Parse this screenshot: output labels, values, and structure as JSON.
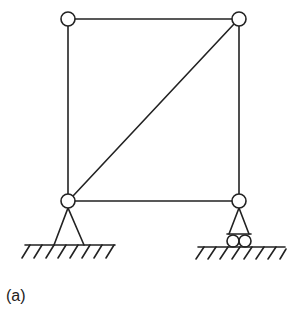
{
  "figure": {
    "caption": "(a)",
    "type": "truss-frame",
    "colors": {
      "stroke": "#222222",
      "background": "#ffffff"
    },
    "nodes": [
      {
        "id": "top-left",
        "x": 68,
        "y": 19
      },
      {
        "id": "top-right",
        "x": 239,
        "y": 19
      },
      {
        "id": "bottom-left",
        "x": 68,
        "y": 201
      },
      {
        "id": "bottom-right",
        "x": 239,
        "y": 201
      }
    ],
    "members": [
      {
        "from": "top-left",
        "to": "top-right"
      },
      {
        "from": "top-left",
        "to": "bottom-left"
      },
      {
        "from": "top-right",
        "to": "bottom-right"
      },
      {
        "from": "bottom-left",
        "to": "bottom-right"
      },
      {
        "from": "bottom-left",
        "to": "top-right"
      }
    ],
    "supports": [
      {
        "node": "bottom-left",
        "type": "pin"
      },
      {
        "node": "bottom-right",
        "type": "roller"
      }
    ]
  }
}
